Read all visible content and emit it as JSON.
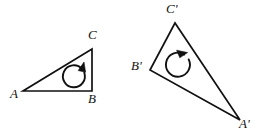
{
  "figure": {
    "type": "geometry-diagram",
    "background_color": "#ffffff",
    "stroke_color": "#111111",
    "canvas": {
      "width": 259,
      "height": 137
    },
    "shapes": [
      {
        "name": "triangle-abc",
        "label": "ABC",
        "points": "23,91 92,91 92,49",
        "vertices": [
          {
            "id": "A",
            "label": "A",
            "x": 23,
            "y": 91,
            "label_x": 10,
            "label_y": 93
          },
          {
            "id": "B",
            "label": "B",
            "x": 92,
            "y": 91,
            "label_x": 87,
            "label_y": 94
          },
          {
            "id": "C",
            "label": "C",
            "x": 92,
            "y": 49,
            "label_x": 88,
            "label_y": 29
          }
        ],
        "rotation_arrow": {
          "name": "rotation-arrow-abc",
          "direction": "counterclockwise",
          "center_x": 77,
          "center_y": 76,
          "radius": 11,
          "arrow_angle_deg": -50
        }
      },
      {
        "name": "triangle-a-prime-b-prime-c-prime",
        "label": "A'B'C'",
        "points": "240,120 150,70 175,23",
        "vertices": [
          {
            "id": "A'",
            "label": "A'",
            "x": 240,
            "y": 120,
            "label_x": 238,
            "label_y": 120
          },
          {
            "id": "B'",
            "label": "B'",
            "x": 150,
            "y": 70,
            "label_x": 131,
            "label_y": 61
          },
          {
            "id": "C'",
            "label": "C'",
            "x": 175,
            "y": 23,
            "label_x": 166,
            "label_y": 3
          }
        ],
        "rotation_arrow": {
          "name": "rotation-arrow-a-prime-b-prime-c-prime",
          "direction": "counterclockwise",
          "center_x": 177,
          "center_y": 64,
          "radius": 12,
          "arrow_angle_deg": -75
        }
      }
    ]
  }
}
